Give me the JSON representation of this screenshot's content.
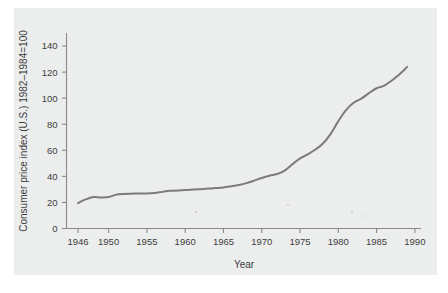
{
  "chart_data": {
    "type": "line",
    "title": "",
    "xlabel": "Year",
    "ylabel": "Consumer price index (U.S.) 1982–1984=100",
    "xlim": [
      1944.5,
      1990.8
    ],
    "ylim": [
      0,
      150
    ],
    "xticks": [
      1946,
      1950,
      1955,
      1960,
      1965,
      1970,
      1975,
      1980,
      1985,
      1990
    ],
    "xtick_labels": [
      "1946",
      "1950",
      "1955",
      "1960",
      "1965",
      "1970",
      "1975",
      "1980",
      "1985",
      "1990"
    ],
    "yticks": [
      0,
      20,
      40,
      60,
      80,
      100,
      120,
      140
    ],
    "ytick_labels": [
      "0",
      "20",
      "40",
      "60",
      "80",
      "100",
      "120",
      "140"
    ],
    "grid": false,
    "legend": null,
    "series": [
      {
        "name": "Consumer price index",
        "x": [
          1946,
          1947,
          1948,
          1949,
          1950,
          1951,
          1952,
          1953,
          1954,
          1955,
          1956,
          1957,
          1958,
          1959,
          1960,
          1961,
          1962,
          1963,
          1964,
          1965,
          1966,
          1967,
          1968,
          1969,
          1970,
          1971,
          1972,
          1973,
          1974,
          1975,
          1976,
          1977,
          1978,
          1979,
          1980,
          1981,
          1982,
          1983,
          1984,
          1985,
          1986,
          1987,
          1988,
          1989
        ],
        "values": [
          19.5,
          22.3,
          24.1,
          23.8,
          24.1,
          26.0,
          26.5,
          26.7,
          26.9,
          26.8,
          27.2,
          28.1,
          28.9,
          29.1,
          29.6,
          29.9,
          30.2,
          30.6,
          31.0,
          31.5,
          32.4,
          33.4,
          34.8,
          36.7,
          38.8,
          40.5,
          41.8,
          44.4,
          49.3,
          53.8,
          56.9,
          60.6,
          65.2,
          72.6,
          82.4,
          90.9,
          96.5,
          99.6,
          103.9,
          107.6,
          109.6,
          113.6,
          118.3,
          124.0
        ]
      }
    ],
    "units": "index (1982-1984=100)"
  },
  "figure": {
    "panel_background": "#eceded",
    "page_background": "#ffffff",
    "line_color": "#7b7b7b",
    "axis_color": "#8a8a8a",
    "text_color": "#3d3d3d"
  }
}
